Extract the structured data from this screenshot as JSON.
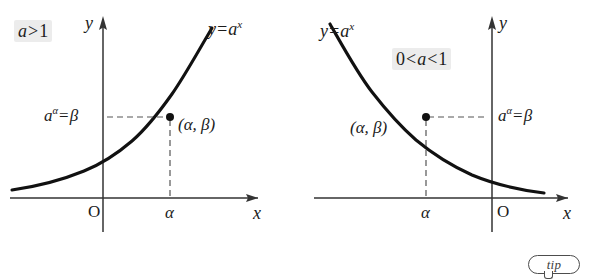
{
  "figure": {
    "background_color": "#ffffff",
    "ink_color": "#1b1b1b",
    "highlight_color": "#ececec",
    "panels": [
      {
        "id": "panel-left",
        "condition_label": "a>1",
        "condition_parts": {
          "base": "a",
          "operator": ">",
          "value": "1"
        },
        "curve_label": "y=a",
        "curve_label_exponent": "x",
        "y_axis_label": "y",
        "x_axis_label": "x",
        "origin_label": "O",
        "x_tick_label": "α",
        "y_value_label_base": "a",
        "y_value_label_exponent": "α",
        "y_value_label_equals": "=",
        "y_value_label_result": "β",
        "point_label": "(α, β)",
        "shape": "increasing"
      },
      {
        "id": "panel-right",
        "condition_label": "0<a<1",
        "condition_parts": {
          "lower": "0",
          "op1": "<",
          "base": "a",
          "op2": "<",
          "upper": "1"
        },
        "curve_label": "y=a",
        "curve_label_exponent": "x",
        "y_axis_label": "y",
        "x_axis_label": "x",
        "origin_label": "O",
        "x_tick_label": "α",
        "y_value_label_base": "a",
        "y_value_label_exponent": "α",
        "y_value_label_equals": "=",
        "y_value_label_result": "β",
        "point_label": "(α, β)",
        "shape": "decreasing"
      }
    ]
  },
  "badge": {
    "label": "tip",
    "icon": "speech-bubble-icon"
  }
}
